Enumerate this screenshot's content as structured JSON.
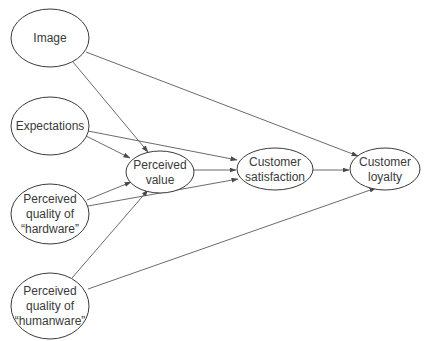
{
  "diagram": {
    "type": "path-model",
    "colors": {
      "stroke": "#3a3a3a",
      "edge": "#5a5a5a",
      "background": "#ffffff",
      "text": "#3a3a3a"
    },
    "nodes": [
      {
        "id": "image",
        "lines": [
          "Image"
        ],
        "cx": 50,
        "cy": 38,
        "rx": 39,
        "ry": 29
      },
      {
        "id": "expectations",
        "lines": [
          "Expectations"
        ],
        "cx": 50,
        "cy": 126,
        "rx": 39,
        "ry": 29
      },
      {
        "id": "hardware",
        "lines": [
          "Perceived",
          "quality of",
          "“hardware”"
        ],
        "cx": 50,
        "cy": 214,
        "rx": 39,
        "ry": 30
      },
      {
        "id": "humanware",
        "lines": [
          "Perceived",
          "quality of",
          "“humanware”"
        ],
        "cx": 50,
        "cy": 306,
        "rx": 39,
        "ry": 33
      },
      {
        "id": "perceived_value",
        "lines": [
          "Perceived",
          "value"
        ],
        "cx": 160,
        "cy": 172,
        "rx": 34,
        "ry": 21
      },
      {
        "id": "customer_satisfaction",
        "lines": [
          "Customer",
          "satisfaction"
        ],
        "cx": 275,
        "cy": 169,
        "rx": 38,
        "ry": 21
      },
      {
        "id": "customer_loyalty",
        "lines": [
          "Customer",
          "loyalty"
        ],
        "cx": 385,
        "cy": 169,
        "rx": 35,
        "ry": 21
      }
    ],
    "edges": [
      {
        "from": "image",
        "to": "perceived_value",
        "x1": 73,
        "y1": 62,
        "x2": 148,
        "y2": 152
      },
      {
        "from": "image",
        "to": "customer_loyalty",
        "x1": 86,
        "y1": 52,
        "x2": 358,
        "y2": 156
      },
      {
        "from": "expectations",
        "to": "perceived_value",
        "x1": 86,
        "y1": 136,
        "x2": 130,
        "y2": 158
      },
      {
        "from": "expectations",
        "to": "customer_satisfaction",
        "x1": 88,
        "y1": 131,
        "x2": 237,
        "y2": 160
      },
      {
        "from": "hardware",
        "to": "perceived_value",
        "x1": 87,
        "y1": 200,
        "x2": 131,
        "y2": 182
      },
      {
        "from": "hardware",
        "to": "customer_satisfaction",
        "x1": 88,
        "y1": 206,
        "x2": 238,
        "y2": 179
      },
      {
        "from": "humanware",
        "to": "perceived_value",
        "x1": 72,
        "y1": 278,
        "x2": 148,
        "y2": 190
      },
      {
        "from": "humanware",
        "to": "customer_loyalty",
        "x1": 88,
        "y1": 289,
        "x2": 376,
        "y2": 188
      },
      {
        "from": "perceived_value",
        "to": "customer_satisfaction",
        "x1": 194,
        "y1": 170,
        "x2": 236,
        "y2": 170
      },
      {
        "from": "customer_satisfaction",
        "to": "customer_loyalty",
        "x1": 313,
        "y1": 170,
        "x2": 349,
        "y2": 170
      }
    ]
  }
}
